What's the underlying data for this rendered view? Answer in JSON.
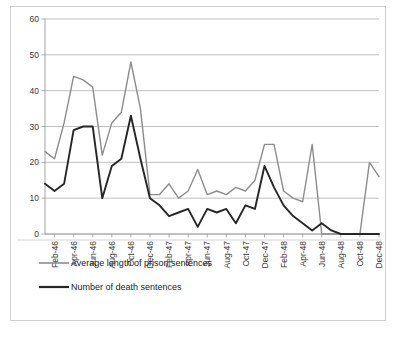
{
  "chart_data": {
    "type": "line",
    "title": "",
    "xlabel": "",
    "ylabel": "",
    "ylim": [
      0,
      60
    ],
    "yticks": [
      0,
      10,
      20,
      30,
      40,
      50,
      60
    ],
    "grid": "horizontal",
    "legend_position": "bottom-left",
    "x": [
      "Jan-46",
      "Feb-46",
      "Mar-46",
      "Apr-46",
      "May-46",
      "Jun-46",
      "Jul-46",
      "Aug-46",
      "Sep-46",
      "Oct-46",
      "Nov-46",
      "Dec-46",
      "Jan-47",
      "Feb-47",
      "Mar-47",
      "Apr-47",
      "May-47",
      "Jun-47",
      "Jul-47",
      "Aug-47",
      "Sep-47",
      "Oct-47",
      "Nov-47",
      "Dec-47",
      "Jan-48",
      "Feb-48",
      "Mar-48",
      "Apr-48",
      "May-48",
      "Jun-48",
      "Jul-48",
      "Aug-48",
      "Sep-48",
      "Oct-48",
      "Nov-48",
      "Dec-48"
    ],
    "xtick_labels": [
      "Feb-46",
      "Apr-46",
      "Jun-46",
      "Aug-46",
      "Oct-46",
      "Dec-46",
      "Feb-47",
      "Apr-47",
      "Jun-47",
      "Aug-47",
      "Oct-47",
      "Dec-47",
      "Feb-48",
      "Apr-48",
      "Jun-48",
      "Aug-48",
      "Oct-48",
      "Dec-48"
    ],
    "series": [
      {
        "name": "Average length of prison sentences",
        "color": "#8c8c8c",
        "values": [
          23,
          21,
          31,
          44,
          43,
          41,
          22,
          31,
          34,
          48,
          35,
          11,
          11,
          14,
          10,
          12,
          18,
          11,
          12,
          11,
          13,
          12,
          15,
          25,
          25,
          12,
          10,
          9,
          25,
          0,
          0,
          0,
          0,
          0,
          20,
          16
        ]
      },
      {
        "name": "Number of death sentences",
        "color": "#262626",
        "values": [
          14,
          12,
          14,
          29,
          30,
          30,
          10,
          19,
          21,
          33,
          21,
          10,
          8,
          5,
          6,
          7,
          2,
          7,
          6,
          7,
          3,
          8,
          7,
          19,
          13,
          8,
          5,
          3,
          1,
          3,
          1,
          0,
          0,
          0,
          0,
          0
        ]
      }
    ]
  },
  "legend": {
    "items": [
      {
        "label": "Average length of prison sentences",
        "color": "#8c8c8c"
      },
      {
        "label": "Number of death sentences",
        "color": "#262626"
      }
    ]
  }
}
